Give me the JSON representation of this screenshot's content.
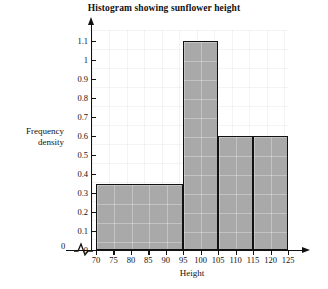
{
  "chart_data": {
    "type": "bar",
    "title": "Histogram showing sunflower height",
    "xlabel": "Height",
    "ylabel": "Frequency density",
    "ylabel_line1": "Frequency",
    "ylabel_line2": "density",
    "grid": true,
    "legend": "none",
    "xlim": [
      70,
      125
    ],
    "ylim": [
      0,
      1.1
    ],
    "x_axis_break": true,
    "x_origin_label": "0",
    "xticks": [
      70,
      75,
      80,
      85,
      90,
      95,
      100,
      105,
      110,
      115,
      120,
      125
    ],
    "xtick_labels": [
      "70",
      "75",
      "80",
      "85",
      "90",
      "95",
      "100",
      "105",
      "110",
      "115",
      "120",
      "125"
    ],
    "yticks": [
      0,
      0.1,
      0.2,
      0.3,
      0.4,
      0.5,
      0.6,
      0.7,
      0.8,
      0.9,
      1.0,
      1.1
    ],
    "ytick_labels": [
      "0",
      "0.1",
      "0.2",
      "0.3",
      "0.4",
      "0.5",
      "0.6",
      "0.7",
      "0.8",
      "0.9",
      "1",
      "1.1"
    ],
    "bins": [
      {
        "label": "70-95",
        "start": 70,
        "end": 95,
        "value": 0.35
      },
      {
        "label": "95-105",
        "start": 95,
        "end": 105,
        "value": 1.1
      },
      {
        "label": "105-115",
        "start": 105,
        "end": 115,
        "value": 0.6
      },
      {
        "label": "115-125",
        "start": 115,
        "end": 125,
        "value": 0.6
      }
    ],
    "colors": {
      "bar_fill": "#a9a9a9",
      "bar_border": "#111111",
      "axis": "#111111",
      "background": "#ffffff",
      "grid": "#f0f0f0"
    }
  }
}
